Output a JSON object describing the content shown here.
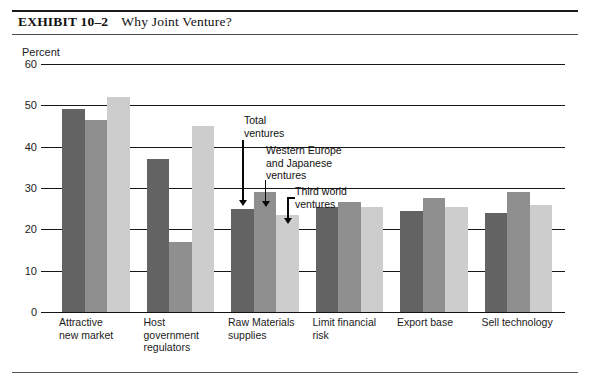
{
  "exhibit": {
    "label": "EXHIBIT 10–2",
    "title": "Why Joint Venture?"
  },
  "chart_data": {
    "type": "bar",
    "title": "Why Joint Venture?",
    "xlabel": "",
    "ylabel": "Percent",
    "ylim": [
      0,
      60
    ],
    "yticks": [
      0,
      10,
      20,
      30,
      40,
      50,
      60
    ],
    "grid": true,
    "legend_position": "annotations",
    "categories": [
      "Attractive\nnew market",
      "Host\ngovernment\nregulators",
      "Raw Materials\nsupplies",
      "Limit financial\nrisk",
      "Export base",
      "Sell technology"
    ],
    "series": [
      {
        "name": "Total ventures",
        "color": "#636363",
        "values": [
          49,
          37,
          25,
          25.5,
          24.5,
          24
        ]
      },
      {
        "name": "Western Europe and Japanese ventures",
        "color": "#8f8f8f",
        "values": [
          46.5,
          17,
          29,
          26.5,
          27.5,
          29
        ]
      },
      {
        "name": "Third world ventures",
        "color": "#cdcdcd",
        "values": [
          52,
          45,
          23.5,
          25.5,
          25.5,
          26
        ]
      }
    ],
    "annotations": [
      "Total\nventures",
      "Western Europe\nand Japanese\nventures",
      "Third world\nventures"
    ]
  }
}
